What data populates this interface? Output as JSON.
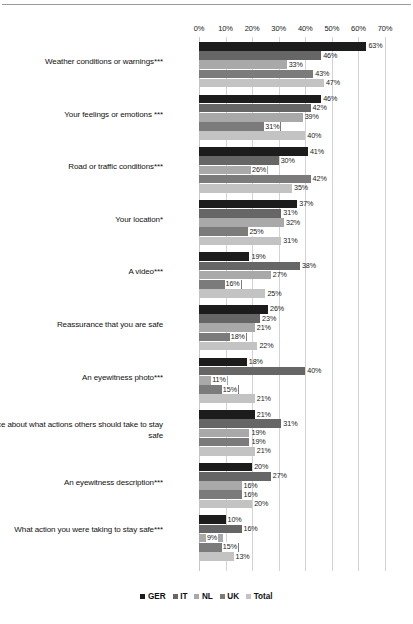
{
  "chart_data": {
    "type": "bar",
    "orientation": "horizontal",
    "title": "",
    "xlabel": "",
    "ylabel": "",
    "xlim": [
      0,
      70
    ],
    "xtick_labels": [
      "0%",
      "10%",
      "20%",
      "30%",
      "40%",
      "50%",
      "60%",
      "70%"
    ],
    "xticks": [
      0,
      10,
      20,
      30,
      40,
      50,
      60,
      70
    ],
    "grid": "vertical",
    "legend_position": "bottom",
    "value_suffix": "%",
    "series": [
      {
        "name": "GER",
        "color": "#1c1c1c",
        "values": [
          63,
          46,
          41,
          37,
          19,
          26,
          18,
          21,
          20,
          10
        ]
      },
      {
        "name": "IT",
        "color": "#666666",
        "values": [
          46,
          42,
          30,
          31,
          38,
          23,
          40,
          31,
          27,
          16
        ]
      },
      {
        "name": "NL",
        "color": "#a9a9a9",
        "values": [
          33,
          39,
          26,
          32,
          27,
          21,
          11,
          19,
          16,
          9
        ]
      },
      {
        "name": "UK",
        "color": "#7b7b7b",
        "values": [
          43,
          31,
          42,
          25,
          16,
          18,
          15,
          19,
          16,
          15
        ]
      },
      {
        "name": "Total",
        "color": "#c3c3c3",
        "values": [
          47,
          40,
          35,
          31,
          25,
          22,
          21,
          21,
          20,
          13
        ]
      }
    ],
    "categories": [
      "Weather conditions or warnings***",
      "Your feelings or emotions ***",
      "Road or traffic conditions***",
      "Your location*",
      "A video***",
      "Reassurance that you are safe",
      "An eyewitness photo***",
      "Advice about what actions others should take to stay safe",
      "An eyewitness description***",
      "What action you were taking to stay safe***"
    ],
    "data_labels": [
      [
        "63%",
        "46%",
        "33%",
        "43%",
        "47%"
      ],
      [
        "46%",
        "42%",
        "39%",
        "31%",
        "40%"
      ],
      [
        "41%",
        "30%",
        "26%",
        "42%",
        "35%"
      ],
      [
        "37%",
        "31%",
        "32%",
        "25%",
        "31%"
      ],
      [
        "19%",
        "38%",
        "27%",
        "16%",
        "25%"
      ],
      [
        "26%",
        "23%",
        "21%",
        "18%",
        "22%"
      ],
      [
        "18%",
        "40%",
        "11%",
        "15%",
        "21%"
      ],
      [
        "21%",
        "31%",
        "19%",
        "19%",
        "21%"
      ],
      [
        "20%",
        "27%",
        "16%",
        "16%",
        "20%"
      ],
      [
        "10%",
        "16%",
        "9%",
        "15%",
        "13%"
      ]
    ]
  },
  "legend": {
    "items": [
      {
        "label": "GER",
        "color": "#1c1c1c"
      },
      {
        "label": "IT",
        "color": "#666666"
      },
      {
        "label": "NL",
        "color": "#a9a9a9"
      },
      {
        "label": "UK",
        "color": "#7b7b7b"
      },
      {
        "label": "Total",
        "color": "#c3c3c3"
      }
    ]
  }
}
